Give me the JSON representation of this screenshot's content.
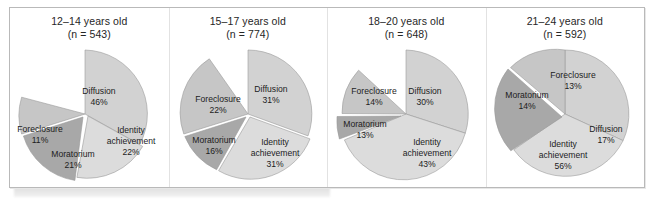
{
  "figure": {
    "colors": {
      "diffusion": "#d2d2d2",
      "foreclosure": "#c6c6c6",
      "moratorium": "#a8a8a8",
      "identity_achievement": "#dcdcdc",
      "outline": "#9a9a9a",
      "frame_border": "#b9b9b9",
      "text": "#262626",
      "background": "#ffffff"
    },
    "category_names": {
      "diffusion": "Diffusion",
      "foreclosure": "Foreclosure",
      "moratorium": "Moratorium",
      "identity_achievement": "Identity\nachievement"
    }
  },
  "chart_data": [
    {
      "type": "pie",
      "title": "12–14 years old\n(n = 543)",
      "age_group": "12–14 years old",
      "n": 543,
      "categories": [
        "Diffusion",
        "Foreclosure",
        "Moratorium",
        "Identity achievement"
      ],
      "values": [
        46,
        11,
        21,
        22
      ],
      "labels": [
        "46%",
        "11%",
        "21%",
        "22%"
      ],
      "label_texts": {
        "diffusion": "Diffusion",
        "diffusion_pct": "46%",
        "foreclosure": "Foreclosure",
        "foreclosure_pct": "11%",
        "moratorium": "Moratorium",
        "moratorium_pct": "21%",
        "identity_line1": "Identity",
        "identity_line2": "achievement",
        "identity_pct": "22%"
      }
    },
    {
      "type": "pie",
      "title": "15–17 years old\n(n = 774)",
      "age_group": "15–17 years old",
      "n": 774,
      "categories": [
        "Diffusion",
        "Foreclosure",
        "Moratorium",
        "Identity achievement"
      ],
      "values": [
        31,
        22,
        16,
        31
      ],
      "labels": [
        "31%",
        "22%",
        "16%",
        "31%"
      ],
      "label_texts": {
        "diffusion": "Diffusion",
        "diffusion_pct": "31%",
        "foreclosure": "Foreclosure",
        "foreclosure_pct": "22%",
        "moratorium": "Moratorium",
        "moratorium_pct": "16%",
        "identity_line1": "Identity",
        "identity_line2": "achievement",
        "identity_pct": "31%"
      }
    },
    {
      "type": "pie",
      "title": "18–20 years old\n(n = 648)",
      "age_group": "18–20 years old",
      "n": 648,
      "categories": [
        "Diffusion",
        "Foreclosure",
        "Moratorium",
        "Identity achievement"
      ],
      "values": [
        30,
        14,
        13,
        43
      ],
      "labels": [
        "30%",
        "14%",
        "13%",
        "43%"
      ],
      "label_texts": {
        "diffusion": "Diffusion",
        "diffusion_pct": "30%",
        "foreclosure": "Foreclosure",
        "foreclosure_pct": "14%",
        "moratorium": "Moratorium",
        "moratorium_pct": "13%",
        "identity_line1": "Identity",
        "identity_line2": "achievement",
        "identity_pct": "43%"
      }
    },
    {
      "type": "pie",
      "title": "21–24 years old\n(n = 592)",
      "age_group": "21–24 years old",
      "n": 592,
      "categories": [
        "Diffusion",
        "Foreclosure",
        "Moratorium",
        "Identity achievement"
      ],
      "values": [
        17,
        13,
        14,
        56
      ],
      "labels": [
        "17%",
        "13%",
        "14%",
        "56%"
      ],
      "label_texts": {
        "diffusion": "Diffusion",
        "diffusion_pct": "17%",
        "foreclosure": "Foreclosure",
        "foreclosure_pct": "13%",
        "moratorium": "Moratorium",
        "moratorium_pct": "14%",
        "identity_line1": "Identity",
        "identity_line2": "achievement",
        "identity_pct": "56%"
      }
    }
  ]
}
